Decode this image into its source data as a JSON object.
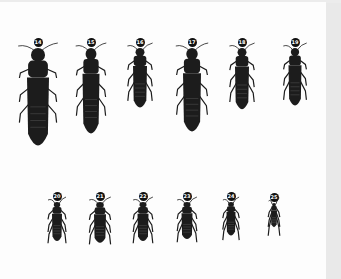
{
  "figure": {
    "background": "#fdfdfd",
    "margin_color": "#e9e9e9",
    "specimen_color": "#1c1c1c",
    "rows": [
      {
        "specimens": [
          {
            "label": "14",
            "x": 38,
            "y": 42,
            "len": 105,
            "w": 22
          },
          {
            "label": "15",
            "x": 91,
            "y": 42,
            "len": 92,
            "w": 17
          },
          {
            "label": "16",
            "x": 140,
            "y": 42,
            "len": 64,
            "w": 14
          },
          {
            "label": "17",
            "x": 192,
            "y": 42,
            "len": 90,
            "w": 18
          },
          {
            "label": "18",
            "x": 242,
            "y": 42,
            "len": 66,
            "w": 14
          },
          {
            "label": "19",
            "x": 295,
            "y": 42,
            "len": 62,
            "w": 13
          }
        ]
      },
      {
        "specimens": [
          {
            "label": "20",
            "x": 57,
            "y": 196,
            "len": 42,
            "w": 10
          },
          {
            "label": "21",
            "x": 100,
            "y": 196,
            "len": 44,
            "w": 12
          },
          {
            "label": "22",
            "x": 143,
            "y": 196,
            "len": 42,
            "w": 11
          },
          {
            "label": "23",
            "x": 187,
            "y": 196,
            "len": 40,
            "w": 11
          },
          {
            "label": "24",
            "x": 231,
            "y": 196,
            "len": 36,
            "w": 9
          },
          {
            "label": "25",
            "x": 274,
            "y": 197,
            "len": 26,
            "w": 6
          }
        ]
      }
    ]
  }
}
